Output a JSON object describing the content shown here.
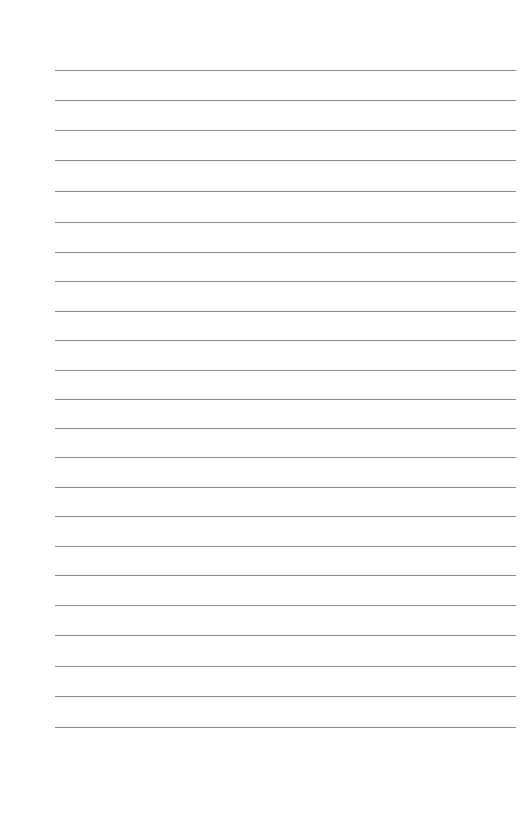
{
  "page": {
    "type": "lined-paper",
    "background_color": "#ffffff",
    "line_color": "#8a8a8a",
    "line_count": 23,
    "line_left": 55,
    "line_right": 516,
    "line_positions": [
      70,
      100,
      130,
      160,
      191,
      222,
      252,
      281,
      311,
      340,
      370,
      399,
      428,
      457,
      487,
      516,
      546,
      575,
      605,
      635,
      666,
      696,
      727
    ]
  }
}
